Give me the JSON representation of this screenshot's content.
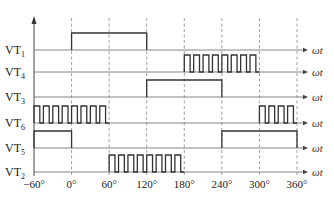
{
  "diagram": {
    "type": "timing-diagram",
    "x_axis": {
      "variable": "ωt",
      "ticks": [
        {
          "deg": -60,
          "label": "−60°"
        },
        {
          "deg": 0,
          "label": "0°"
        },
        {
          "deg": 60,
          "label": "60°"
        },
        {
          "deg": 120,
          "label": "120°"
        },
        {
          "deg": 180,
          "label": "180°"
        },
        {
          "deg": 240,
          "label": "240°"
        },
        {
          "deg": 300,
          "label": "300°"
        },
        {
          "deg": 360,
          "label": "360°"
        }
      ],
      "dashed_gridlines_deg": [
        0,
        60,
        120,
        180,
        240,
        300,
        360
      ]
    },
    "signals": [
      {
        "name": "VT",
        "sub": "1",
        "baseline_y": 50,
        "segments": [
          {
            "start": 0,
            "end": 120,
            "mode": "continuous"
          }
        ]
      },
      {
        "name": "VT",
        "sub": "4",
        "baseline_y": 72,
        "segments": [
          {
            "start": 180,
            "end": 300,
            "mode": "chopped",
            "pulses": 8
          }
        ]
      },
      {
        "name": "VT",
        "sub": "3",
        "baseline_y": 97,
        "segments": [
          {
            "start": 120,
            "end": 240,
            "mode": "continuous"
          }
        ]
      },
      {
        "name": "VT",
        "sub": "6",
        "baseline_y": 123,
        "segments": [
          {
            "start": -60,
            "end": 60,
            "mode": "chopped",
            "pulses": 8
          },
          {
            "start": 300,
            "end": 360,
            "mode": "chopped",
            "pulses": 4
          }
        ]
      },
      {
        "name": "VT",
        "sub": "5",
        "baseline_y": 148,
        "segments": [
          {
            "start": -60,
            "end": 0,
            "mode": "continuous"
          },
          {
            "start": 240,
            "end": 360,
            "mode": "continuous"
          }
        ]
      },
      {
        "name": "VT",
        "sub": "2",
        "baseline_y": 172,
        "segments": [
          {
            "start": 60,
            "end": 180,
            "mode": "chopped",
            "pulses": 8
          }
        ]
      }
    ],
    "pulse_height": 17
  }
}
